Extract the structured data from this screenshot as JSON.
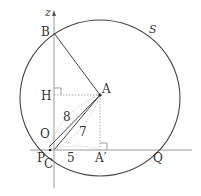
{
  "diagram": {
    "type": "geometry",
    "circle_label": "S",
    "axis_label": "z",
    "points": {
      "B": "B",
      "H": "H",
      "A": "A",
      "O": "O",
      "P": "P",
      "C": "C",
      "A_prime": "A′",
      "Q": "Q"
    },
    "lengths": {
      "OA": "8",
      "CA": "7",
      "CA_prime": "5"
    },
    "colors": {
      "stroke": "#333333",
      "axis": "#999999",
      "dotted": "#aaaaaa"
    }
  }
}
